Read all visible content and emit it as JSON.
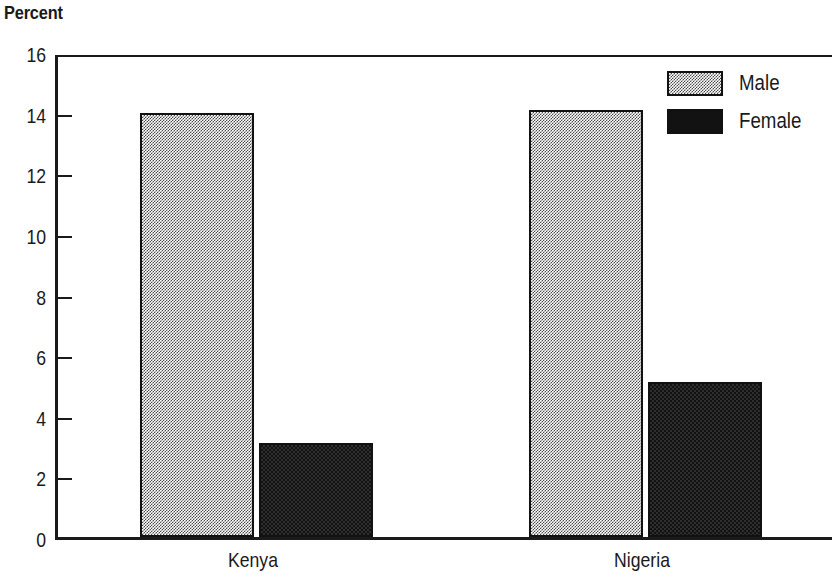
{
  "chart_data": {
    "type": "bar",
    "title": "",
    "ylabel": "Percent",
    "xlabel": "",
    "categories": [
      "Kenya",
      "Nigeria"
    ],
    "series": [
      {
        "name": "Male",
        "values": [
          14.0,
          14.1
        ],
        "color": "#808080",
        "pattern": "checker-gray"
      },
      {
        "name": "Female",
        "values": [
          3.1,
          5.1
        ],
        "color": "#121212",
        "pattern": "solid-black"
      }
    ],
    "ylim": [
      0,
      16
    ],
    "ytick_step": 2,
    "ytick_labels": [
      "16",
      "14",
      "12",
      "10",
      "8",
      "6",
      "4",
      "2",
      "0"
    ],
    "ytick_values": [
      16,
      14,
      12,
      10,
      8,
      6,
      4,
      2,
      0
    ],
    "grid": false,
    "legend_position": "top-right",
    "legend_entries": [
      "Male",
      "Female"
    ]
  },
  "axis": {
    "y_title": "Percent"
  },
  "legend": {
    "male_label": "Male",
    "female_label": "Female"
  },
  "xaxis": {
    "labels": [
      "Kenya",
      "Nigeria"
    ]
  }
}
